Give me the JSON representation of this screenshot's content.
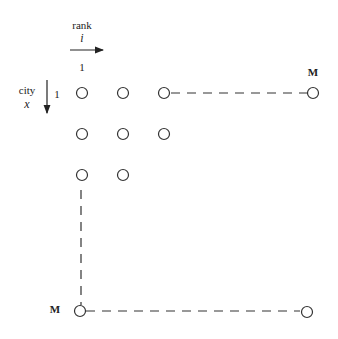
{
  "diagram": {
    "axes": {
      "rank": {
        "label": "rank",
        "symbol": "i",
        "start_index": "1"
      },
      "city": {
        "label": "city",
        "symbol": "x",
        "start_index": "1"
      }
    },
    "corner_labels": {
      "top_right": "M",
      "bottom_left": "M"
    },
    "nodes": [
      {
        "row": 1,
        "col": 1,
        "x": 82,
        "y": 93
      },
      {
        "row": 1,
        "col": 2,
        "x": 123,
        "y": 93
      },
      {
        "row": 1,
        "col": 3,
        "x": 164,
        "y": 93
      },
      {
        "row": 1,
        "col": "M",
        "x": 313,
        "y": 93
      },
      {
        "row": 2,
        "col": 1,
        "x": 82,
        "y": 134
      },
      {
        "row": 2,
        "col": 2,
        "x": 123,
        "y": 134
      },
      {
        "row": 2,
        "col": 3,
        "x": 164,
        "y": 134
      },
      {
        "row": 3,
        "col": 1,
        "x": 82,
        "y": 175
      },
      {
        "row": 3,
        "col": 2,
        "x": 123,
        "y": 175
      },
      {
        "row": "M",
        "col": 1,
        "x": 80,
        "y": 311
      },
      {
        "row": "M",
        "col": "M",
        "x": 307,
        "y": 312
      }
    ],
    "dashed_lines": [
      {
        "from": [
          171,
          93
        ],
        "to": [
          307,
          93
        ]
      },
      {
        "from": [
          81,
          190
        ],
        "to": [
          81,
          305
        ]
      },
      {
        "from": [
          86,
          311
        ],
        "to": [
          300,
          311
        ]
      }
    ],
    "colors": {
      "stroke": "#333333",
      "text": "#222222",
      "background": "#ffffff"
    }
  }
}
